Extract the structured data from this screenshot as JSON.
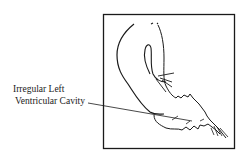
{
  "figure": {
    "annotation": {
      "line1": "Irregular Left",
      "line2": "Ventricular Cavity"
    },
    "colors": {
      "ink": "#1a1a1a",
      "background": "#ffffff"
    },
    "frame": {
      "x": 103,
      "y": 14,
      "width": 131,
      "height": 134
    }
  }
}
